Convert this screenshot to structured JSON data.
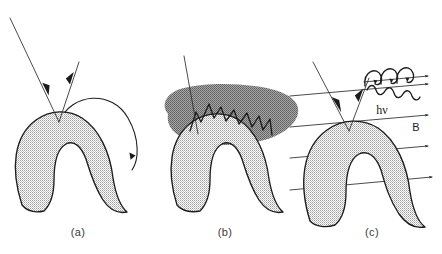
{
  "figure": {
    "background_color": "#ffffff",
    "ink_color": "#1c1c1c",
    "body_fill_color": "#c9c9c9",
    "cloud_fill_color": "#8d8d8d",
    "panel_count": 3
  },
  "panels": [
    {
      "id": "a",
      "caption": "(a)",
      "caption_x": 78,
      "caption_y": 236,
      "description": "crescent body with incoming and outgoing particle rays meeting at apex and two returning arc trajectories",
      "elements": {
        "incoming_ray_label": "",
        "outgoing_ray_label": "",
        "arc_small_label": "",
        "arc_large_label": ""
      }
    },
    {
      "id": "b",
      "caption": "(b)",
      "caption_x": 225,
      "caption_y": 236,
      "description": "crescent body capped by dark turbulent cloud containing a jagged zigzag path, pierced by an incoming ray",
      "elements": {
        "incoming_ray_label": "",
        "cloud_label": "",
        "zigzag_label": ""
      }
    },
    {
      "id": "c",
      "caption": "(c)",
      "caption_x": 372,
      "caption_y": 236,
      "description": "crescent body with incoming and outgoing rays, helical gyration along field direction, emitted photon wave, and parallel magnetic field lines",
      "elements": {
        "photon_label": "hν",
        "photon_label_x": 382,
        "photon_label_y": 110,
        "field_label": "B",
        "field_label_x": 416,
        "field_label_y": 129,
        "field_line_count": 4,
        "helix_loop_count": 3
      }
    }
  ],
  "annotations": {
    "photon": "hν",
    "magnetic_field": "B"
  },
  "captions": {
    "a": "(a)",
    "b": "(b)",
    "c": "(c)"
  }
}
